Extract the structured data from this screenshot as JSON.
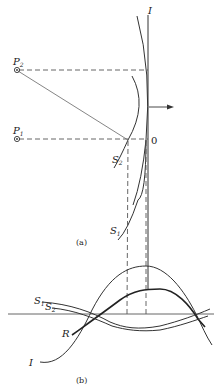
{
  "figure_a": {
    "caption": "(a)",
    "labels": {
      "I": "I",
      "P2": "P",
      "P2_sub": "2",
      "P1": "P",
      "P1_sub": "1",
      "origin": "0",
      "S2": "S",
      "S2_sub": "2",
      "S1": "S",
      "S1_sub": "1"
    },
    "arrow_direction": "right"
  },
  "figure_b": {
    "caption": "(b)",
    "labels": {
      "S1": "S",
      "S1_sub": "1",
      "S2": "S",
      "S2_sub": "2",
      "R": "R",
      "I": "I"
    },
    "curves": [
      "I",
      "R",
      "S1",
      "S2"
    ]
  },
  "colors": {
    "line": "#333333",
    "background": "#ffffff"
  }
}
